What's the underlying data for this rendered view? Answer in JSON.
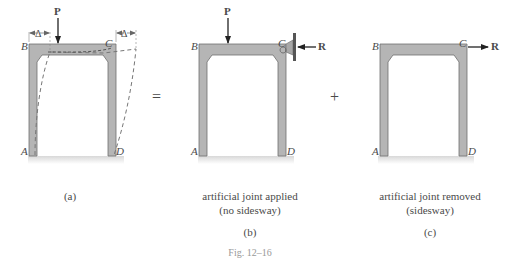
{
  "figure": {
    "caption": "Fig. 12–16",
    "operators": {
      "equals": "=",
      "plus": "+"
    },
    "panels": [
      {
        "id": "a",
        "label": "(a)",
        "description": "",
        "description_line2": "",
        "joints": {
          "A": "A",
          "B": "B",
          "C": "C",
          "D": "D"
        },
        "load": "P",
        "displacement_left": "Δ",
        "displacement_right": "Δ"
      },
      {
        "id": "b",
        "label": "(b)",
        "description": "artificial joint applied",
        "description_line2": "(no sidesway)",
        "joints": {
          "A": "A",
          "B": "B",
          "C": "C",
          "D": "D"
        },
        "load": "P",
        "reaction": "R"
      },
      {
        "id": "c",
        "label": "(c)",
        "description": "artificial joint removed",
        "description_line2": "(sidesway)",
        "joints": {
          "A": "A",
          "B": "B",
          "C": "C",
          "D": "D"
        },
        "reaction": "R"
      }
    ],
    "colors": {
      "frame_fill": "#b5b5b5",
      "frame_edge": "#6f6f6f",
      "ground_shadow": "#d6d6d6",
      "arrow": "#222222",
      "dashed": "#7a7a7a"
    }
  }
}
